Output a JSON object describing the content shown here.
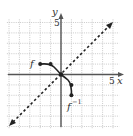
{
  "diagram": {
    "type": "function-inverse-graph",
    "axes": {
      "x_label": "x",
      "y_label": "y",
      "x_tick_label": "5",
      "y_tick_label": "5",
      "range": [
        -5,
        5
      ]
    },
    "curves": [
      {
        "name": "f",
        "label": "f",
        "points": [
          [
            -2,
            1
          ],
          [
            -1,
            1
          ],
          [
            0,
            0
          ]
        ]
      },
      {
        "name": "f_inverse",
        "label": "f",
        "label_sup": "−1",
        "points": [
          [
            0,
            0
          ],
          [
            1,
            -1
          ],
          [
            1,
            -2
          ]
        ]
      }
    ],
    "reference_line": {
      "equation": "y = x",
      "style": "dashed"
    },
    "colors": {
      "grid": "#bdbdbd",
      "axis": "#555555",
      "curve": "#222222"
    }
  }
}
